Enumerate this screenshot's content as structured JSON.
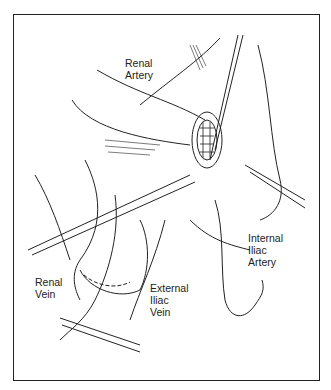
{
  "figure": {
    "labels": {
      "renal_artery": [
        "Renal",
        "Artery"
      ],
      "internal_iliac_artery": [
        "Internal",
        "Iliac",
        "Artery"
      ],
      "renal_vein": [
        "Renal",
        "Vein"
      ],
      "external_iliac_vein": [
        "External",
        "Iliac",
        "Vein"
      ]
    }
  }
}
